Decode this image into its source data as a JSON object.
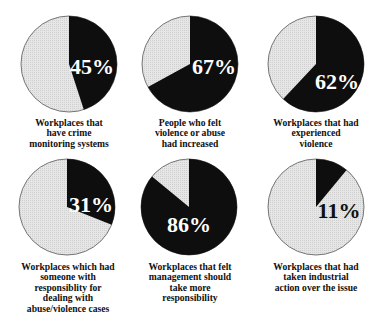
{
  "colors": {
    "dark": "#0e0e0e",
    "light": "#e6e6e6",
    "outline": "#555555",
    "label_on_dark": "#ffffff",
    "label_on_light": "#111111"
  },
  "chart_data": [
    {
      "type": "pie",
      "title": "Workplaces that have crime monitoring systems",
      "values": [
        45,
        55
      ],
      "labels": [
        "Yes",
        "No"
      ],
      "annotation": "45%",
      "highlighted_value": 45
    },
    {
      "type": "pie",
      "title": "People who felt violence or abuse had increased",
      "values": [
        67,
        33
      ],
      "labels": [
        "Yes",
        "No"
      ],
      "annotation": "67%",
      "highlighted_value": 67
    },
    {
      "type": "pie",
      "title": "Workplaces that had experienced violence",
      "values": [
        62,
        38
      ],
      "labels": [
        "Yes",
        "No"
      ],
      "annotation": "62%",
      "highlighted_value": 62
    },
    {
      "type": "pie",
      "title": "Workplaces which had someone with responsiblity for dealing with abuse/violence cases",
      "values": [
        31,
        69
      ],
      "labels": [
        "Yes",
        "No"
      ],
      "annotation": "31%",
      "highlighted_value": 31
    },
    {
      "type": "pie",
      "title": "Workplaces that felt management should take more responsibility",
      "values": [
        86,
        14
      ],
      "labels": [
        "Yes",
        "No"
      ],
      "annotation": "86%",
      "highlighted_value": 86
    },
    {
      "type": "pie",
      "title": "Workplaces that had taken industrial action over the issue",
      "values": [
        11,
        89
      ],
      "labels": [
        "Yes",
        "No"
      ],
      "annotation": "11%",
      "highlighted_value": 11
    }
  ],
  "pies": [
    {
      "pct_label": "45%",
      "value": 45,
      "caption": [
        "Workplaces that",
        "have crime",
        "monitoring systems"
      ]
    },
    {
      "pct_label": "67%",
      "value": 67,
      "caption": [
        "People who felt",
        "violence or abuse",
        "had increased"
      ]
    },
    {
      "pct_label": "62%",
      "value": 62,
      "caption": [
        "Workplaces that had",
        "experienced",
        "violence"
      ]
    },
    {
      "pct_label": "31%",
      "value": 31,
      "caption": [
        "Workplaces which had",
        "someone with",
        "responsiblity for",
        "dealing with",
        "abuse/violence cases"
      ]
    },
    {
      "pct_label": "86%",
      "value": 86,
      "caption": [
        "Workplaces that felt",
        "management should",
        "take more",
        "responsibility"
      ]
    },
    {
      "pct_label": "11%",
      "value": 11,
      "caption": [
        "Workplaces that had",
        "taken industrial",
        "action over the issue"
      ]
    }
  ]
}
